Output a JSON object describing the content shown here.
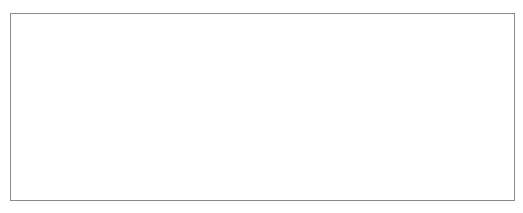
{
  "header": {
    "cut_off_text": ""
  },
  "figure": {
    "stroke_color": "#1e1e1e",
    "frame_color": "#8a8a8a",
    "top_figure": {
      "description": "Hexagon followed by two hourglass (crossed) shapes sharing top and bottom edges",
      "hexagon": [
        [
          183,
          22
        ],
        [
          218,
          22
        ],
        [
          235,
          53
        ],
        [
          218,
          84
        ],
        [
          183,
          84
        ],
        [
          166,
          54
        ]
      ],
      "top_edge": [
        [
          183,
          22
        ],
        [
          326,
          22
        ]
      ],
      "bottom_edge": [
        [
          183,
          84
        ],
        [
          326,
          84
        ]
      ],
      "crosses": [
        [
          [
            [
              218,
              22
            ],
            [
              253,
              84
            ]
          ],
          [
            [
              253,
              22
            ],
            [
              218,
              84
            ]
          ]
        ],
        [
          [
            [
              290,
              22
            ],
            [
              326,
              84
            ]
          ],
          [
            [
              326,
              22
            ],
            [
              290,
              84
            ]
          ]
        ]
      ]
    },
    "bottom_figure": {
      "description": "Two repeating units: peak with vertical stem and inverted triangle",
      "units": [
        {
          "left_arm": [
            [
              105,
              157
            ],
            [
              140,
              121
            ]
          ],
          "stem": [
            [
              140,
              121
            ],
            [
              140,
              193
            ]
          ],
          "descent": [
            [
              140,
              121
            ],
            [
              210,
              191
            ]
          ],
          "triangle_top": [
            [
              175,
              156
            ],
            [
              244,
              156
            ]
          ],
          "ascent": [
            [
              210,
              191
            ],
            [
              277,
              120
            ]
          ]
        },
        {
          "stem": [
            [
              277,
              120
            ],
            [
              277,
              192
            ]
          ],
          "descent": [
            [
              277,
              120
            ],
            [
              347,
              189
            ]
          ],
          "triangle_top": [
            [
              312,
              154
            ],
            [
              382,
              154
            ]
          ],
          "ascent": [
            [
              347,
              189
            ],
            [
              382,
              154
            ]
          ]
        }
      ]
    }
  }
}
